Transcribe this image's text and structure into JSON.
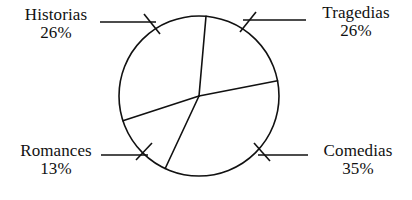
{
  "chart_data": {
    "type": "pie",
    "title": "",
    "subtitle": "",
    "xlabel": "",
    "ylabel": "",
    "legend_position": "callout-labels",
    "grid": false,
    "categories": [
      "Tragedias",
      "Comedias",
      "Romances",
      "Historias"
    ],
    "values": [
      26,
      35,
      13,
      26
    ],
    "value_unit": "%",
    "slices": [
      {
        "label": "Tragedias",
        "value": 26,
        "display_value": "26%",
        "start_angle_deg": 5,
        "end_angle_deg": 79,
        "fill": "#ffffff",
        "stroke": "#111111"
      },
      {
        "label": "Comedias",
        "value": 35,
        "display_value": "35%",
        "start_angle_deg": 79,
        "end_angle_deg": 205,
        "fill": "#ffffff",
        "stroke": "#111111"
      },
      {
        "label": "Romances",
        "value": 13,
        "display_value": "13%",
        "start_angle_deg": 205,
        "end_angle_deg": 252,
        "fill": "#ffffff",
        "stroke": "#111111"
      },
      {
        "label": "Historias",
        "value": 26,
        "display_value": "26%",
        "start_angle_deg": 252,
        "end_angle_deg": 365,
        "fill": "#ffffff",
        "stroke": "#111111"
      }
    ]
  },
  "labels": {
    "historias": {
      "name": "Historias",
      "pct": "26%"
    },
    "tragedias": {
      "name": "Tragedias",
      "pct": "26%"
    },
    "romances": {
      "name": "Romances",
      "pct": "13%"
    },
    "comedias": {
      "name": "Comedias",
      "pct": "35%"
    }
  },
  "style": {
    "stroke_color": "#111111",
    "background": "#ffffff"
  }
}
